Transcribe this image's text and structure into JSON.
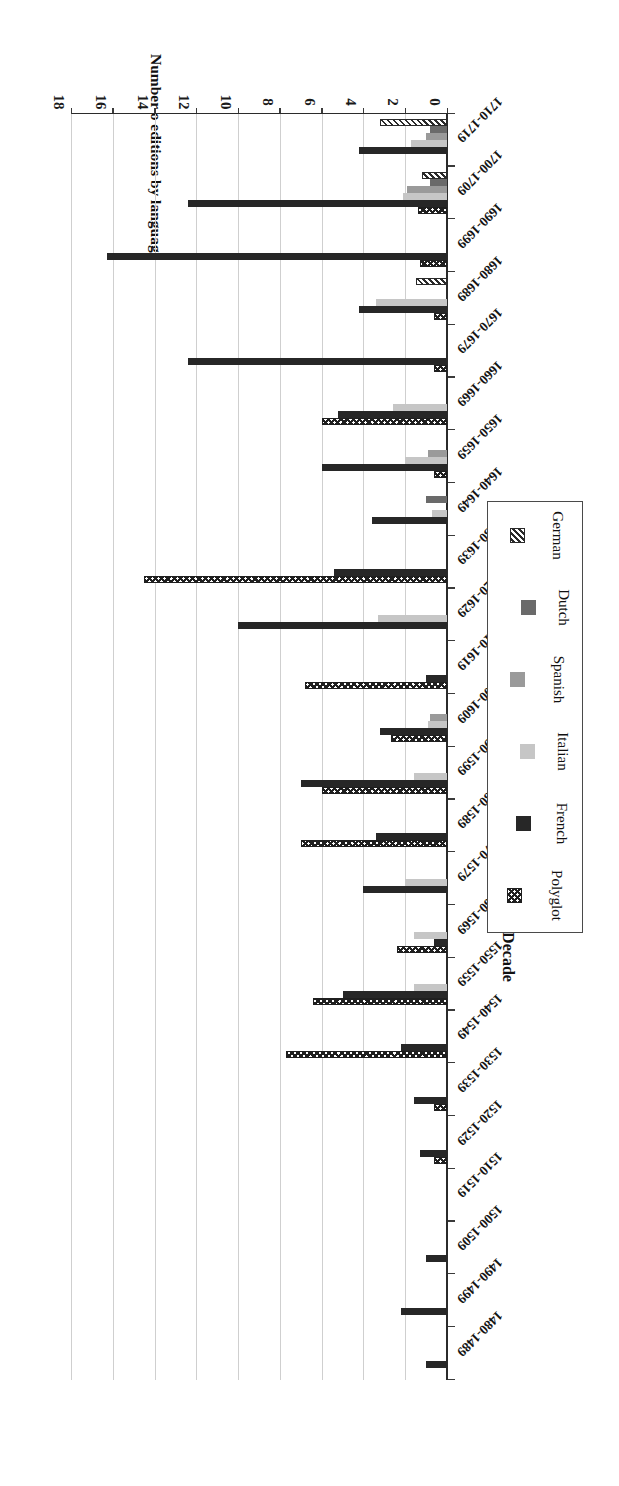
{
  "chart_data": {
    "type": "bar",
    "orientation": "horizontal",
    "title": "",
    "xlabel": "Decade",
    "ylabel": "Number o editions by language",
    "ylim": [
      0,
      18
    ],
    "yticks": [
      0,
      2,
      4,
      6,
      8,
      10,
      12,
      14,
      16,
      18
    ],
    "grid": true,
    "legend_position": "right",
    "categories": [
      "1480-1489",
      "1490-1499",
      "1500-1509",
      "1510-1519",
      "1520-1529",
      "1530-1539",
      "1540-1549",
      "1550-1559",
      "1560-1569",
      "1570-1579",
      "1580-1589",
      "1590-1599",
      "1600-1609",
      "1610-1619",
      "1620-1629",
      "1630-1639",
      "1640-1649",
      "1650-1659",
      "1660-1669",
      "1670-1679",
      "1680-1689",
      "1690-1699",
      "1700-1709",
      "1710-1719"
    ],
    "series": [
      {
        "name": "Polyglot",
        "pattern": "checkerboard",
        "color": "#1f1f1f",
        "values": [
          0,
          0,
          0,
          0,
          0.6,
          0.6,
          7.7,
          6.4,
          2.4,
          0,
          7.0,
          6.0,
          2.7,
          6.8,
          0,
          14.5,
          0,
          0.6,
          6.0,
          0.6,
          0.6,
          1.3,
          1.4,
          0
        ]
      },
      {
        "name": "French",
        "pattern": "solid",
        "color": "#272727",
        "values": [
          1.0,
          2.2,
          1.0,
          0,
          1.3,
          1.6,
          2.2,
          5.0,
          0.6,
          4.0,
          3.4,
          7.0,
          3.2,
          1.0,
          10.0,
          5.4,
          3.6,
          6.0,
          5.2,
          12.4,
          4.2,
          16.3,
          12.4,
          4.2
        ]
      },
      {
        "name": "Italian",
        "pattern": "solid",
        "color": "#c6c6c6",
        "values": [
          0,
          0,
          0,
          0,
          0,
          0,
          0,
          1.6,
          1.6,
          2.0,
          0,
          1.6,
          0.9,
          0,
          3.3,
          0,
          0.7,
          2.0,
          2.6,
          0,
          3.4,
          0,
          2.1,
          1.7
        ]
      },
      {
        "name": "Spanish",
        "pattern": "solid",
        "color": "#9a9a9a",
        "values": [
          0,
          0,
          0,
          0,
          0,
          0,
          0,
          0,
          0,
          0,
          0,
          0,
          0.8,
          0,
          0,
          0,
          0,
          0.9,
          0,
          0,
          0,
          0,
          1.9,
          1.0
        ]
      },
      {
        "name": "Dutch",
        "pattern": "solid",
        "color": "#6a6a6a",
        "values": [
          0,
          0,
          0,
          0,
          0,
          0,
          0,
          0,
          0,
          0,
          0,
          0,
          0,
          0,
          0,
          0,
          1.0,
          0,
          0,
          0,
          0,
          0,
          0.8,
          0.8
        ]
      },
      {
        "name": "German",
        "pattern": "diagonal-hatch",
        "color": "#2a2a2a",
        "values": [
          0,
          0,
          0,
          0,
          0,
          0,
          0,
          0,
          0,
          0,
          0,
          0,
          0,
          0,
          0,
          0,
          0,
          0,
          0,
          0,
          1.5,
          0,
          1.2,
          3.2
        ]
      }
    ]
  },
  "axis": {
    "x_title": "Decade",
    "y_title": "Number o editions by language",
    "y_ticklabels": [
      "0",
      "2",
      "4",
      "6",
      "8",
      "10",
      "12",
      "14",
      "16",
      "18"
    ]
  },
  "legend": {
    "title": "",
    "items": [
      {
        "label": "Polyglot",
        "swatch": "checkerboard-swatch"
      },
      {
        "label": "French",
        "swatch": "black-swatch"
      },
      {
        "label": "Italian",
        "swatch": "light-grey-swatch"
      },
      {
        "label": "Spanish",
        "swatch": "mid-grey-swatch"
      },
      {
        "label": "Dutch",
        "swatch": "dark-grey-swatch"
      },
      {
        "label": "German",
        "swatch": "hatched-swatch"
      }
    ]
  }
}
